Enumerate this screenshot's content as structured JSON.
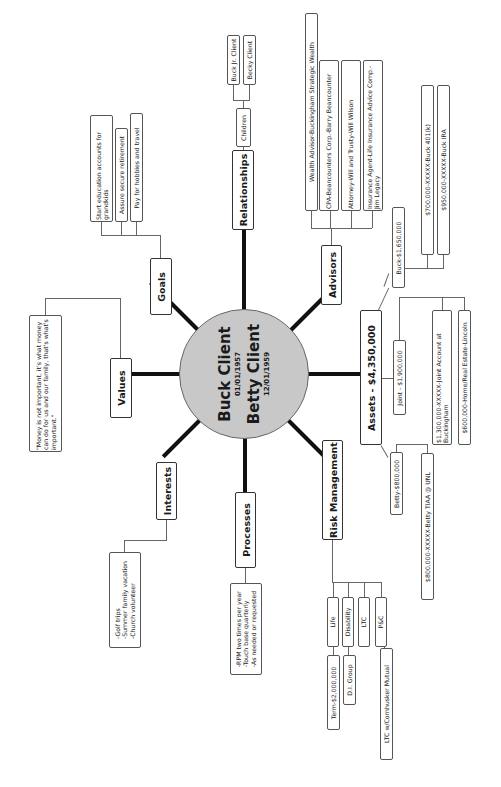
{
  "center": {
    "person1": {
      "name": "Buck Client",
      "dob": "01/01/1957"
    },
    "person2": {
      "name": "Betty Client",
      "dob": "12/01/1959"
    },
    "fill_color": "#c8c8c8"
  },
  "branches": {
    "goals": {
      "label": "Goals",
      "items": [
        "Start education accounts for grandkids",
        "Assure secure retirement",
        "Pay for hobbies and travel"
      ]
    },
    "values": {
      "label": "Values",
      "items": [
        "\"Money is not important, it's what money can do for us and our family, that's what's important.\""
      ]
    },
    "relationships": {
      "label": "Relationships",
      "children_label": "Children",
      "children": [
        "Buck Jr. Client",
        "Becky Client"
      ]
    },
    "advisors": {
      "label": "Advisors",
      "items": [
        "Wealth Advisor-Buckingham Strategic Wealth",
        "CPA-Beancounters Corp.-Barry Beancounter",
        "Attorney-Will and Trusty-Will Wilson",
        "Insurance Agent-Life Insurance Advice Comp.-Jim Legacy"
      ]
    },
    "assets": {
      "label": "Assets - $4,350,000",
      "buck": {
        "label": "Buck-$1,650,000",
        "items": [
          "$700,000-XXXXX-Buck 401(k)",
          "$950,000-XXXXX-Buck IRA"
        ]
      },
      "joint": {
        "label": "Joint - $1,900,000",
        "items": [
          "$1,300,000-XXXXX-Joint Account at Buckingham",
          "$600,000-Home/Real Estate-Lincoln"
        ]
      },
      "betty": {
        "label": "Betty-$800,000",
        "items": [
          "$800,000-XXXXX-Betty TIAA @ UNL"
        ]
      }
    },
    "risk_management": {
      "label": "Risk Management",
      "items": [
        {
          "label": "Life",
          "sub": "Term-$2,000,000"
        },
        {
          "label": "Disability",
          "sub": "D.I. Group"
        },
        {
          "label": "LTC",
          "sub": null
        },
        {
          "label": "P&C",
          "sub": "LTC w/Cornhusker Mutual"
        }
      ]
    },
    "processes": {
      "label": "Processes",
      "items": [
        "-RPM two times per year",
        "-Touch base quarterly",
        "-As needed or requested"
      ]
    },
    "interests": {
      "label": "Interests",
      "items": [
        "-Golf trips",
        "-Summer family vacation",
        "-Church volunteer"
      ]
    }
  }
}
